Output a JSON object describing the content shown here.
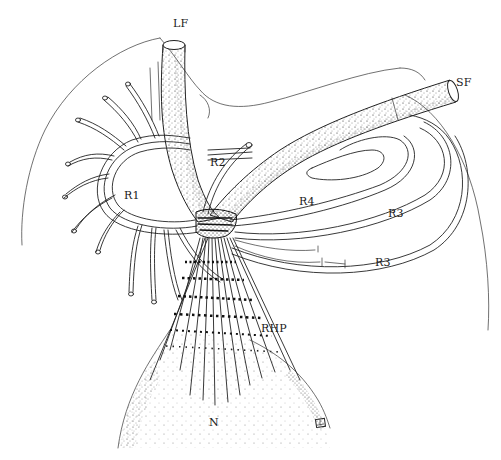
{
  "figure": {
    "type": "anatomical line drawing",
    "background": "#ffffff",
    "ink_color": "#1a1a1a"
  },
  "labels": {
    "lf": "LF",
    "sf": "SF",
    "r1": "R1",
    "r2": "R2",
    "r3_upper": "R3",
    "r3_lower": "R3",
    "r4": "R4",
    "rhp": "RHP",
    "n": "N"
  },
  "structures": [
    {
      "id": "LF",
      "description": "vertical stippled tube (upper left)"
    },
    {
      "id": "SF",
      "description": "diagonal stippled tube (upper right)"
    },
    {
      "id": "R1",
      "description": "ring of radiating tubules (left)"
    },
    {
      "id": "R2",
      "description": "tubule between LF and SF"
    },
    {
      "id": "R3",
      "description": "outer concentric arcs (right)"
    },
    {
      "id": "R4",
      "description": "inner concentric arcs beneath SF"
    },
    {
      "id": "RHP",
      "description": "fan of striped fibers converging at junction"
    },
    {
      "id": "N",
      "description": "stippled bulb at base"
    }
  ]
}
